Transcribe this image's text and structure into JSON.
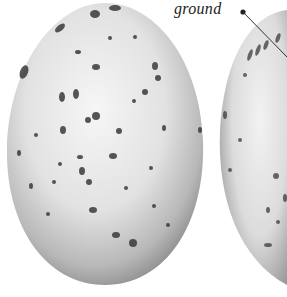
{
  "figure": {
    "annotation_label": "ground",
    "colors": {
      "shell_light": "#f2f2f2",
      "shell_mid": "#c8c8c8",
      "shell_dark": "#8a8a8a",
      "speckle": "#3a3a3a",
      "background": "#ffffff",
      "leader_line": "#333333"
    }
  }
}
